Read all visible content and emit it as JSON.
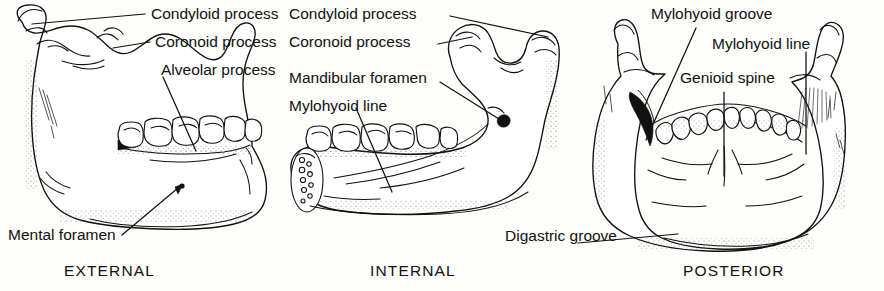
{
  "figure": {
    "ink_color": "#111111",
    "background_color": "#fdfdfb"
  },
  "panels": [
    {
      "id": "external",
      "caption": "EXTERNAL",
      "labels": [
        {
          "id": "condyloid-process",
          "text": "Condyloid process"
        },
        {
          "id": "coronoid-process",
          "text": "Coronoid process"
        },
        {
          "id": "alveolar-process",
          "text": "Alveolar process"
        },
        {
          "id": "mental-foramen",
          "text": "Mental foramen"
        }
      ]
    },
    {
      "id": "internal",
      "caption": "INTERNAL",
      "labels": [
        {
          "id": "condyloid-process",
          "text": "Condyloid process"
        },
        {
          "id": "coronoid-process",
          "text": "Coronoid process"
        },
        {
          "id": "mandibular-foramen",
          "text": "Mandibular foramen"
        },
        {
          "id": "mylohyoid-line",
          "text": "Mylohyoid line"
        }
      ]
    },
    {
      "id": "posterior",
      "caption": "POSTERIOR",
      "labels": [
        {
          "id": "mylohyoid-groove",
          "text": "Mylohyoid groove"
        },
        {
          "id": "mylohyoid-line",
          "text": "Mylohyoid line"
        },
        {
          "id": "genioid-spine",
          "text": "Genioid spine"
        },
        {
          "id": "digastric-groove",
          "text": "Digastric groove"
        }
      ]
    }
  ]
}
